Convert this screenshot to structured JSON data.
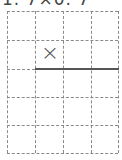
{
  "problem": {
    "title": "1. 7×0. 7",
    "operator": "×"
  },
  "grid": {
    "columns": 4,
    "rows": 5,
    "line_color": "#8a8a8a",
    "solid_line_color": "#555555"
  }
}
